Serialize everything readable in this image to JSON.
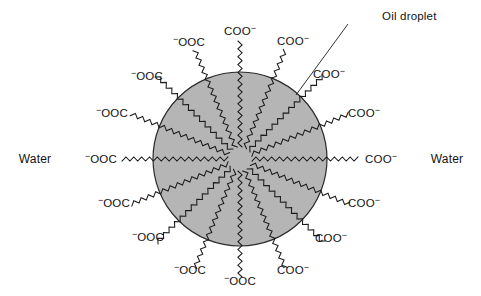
{
  "figure": {
    "type": "emulsion-oil-droplet-surfactant-diagram",
    "width": 481,
    "height": 296,
    "background_color": "#ffffff"
  },
  "droplet": {
    "label": "Oil droplet",
    "center_x": 240,
    "center_y": 159,
    "radius": 87,
    "fill_color": "#b5b5b5",
    "stroke_color": "#2a2a2a"
  },
  "callout": {
    "text": "Oil droplet",
    "text_x": 382,
    "text_y": 17,
    "leader_from_x": 348,
    "leader_from_y": 24,
    "leader_to_x": 296,
    "leader_to_y": 95
  },
  "medium": {
    "left": {
      "text": "Water",
      "x": 35,
      "y": 159
    },
    "right": {
      "text": "Water",
      "x": 447,
      "y": 159
    }
  },
  "head_groups": {
    "left_text": "⁻OOC",
    "right_text": "COO⁻",
    "left_head": "OOC",
    "right_head": "COO",
    "charge": "−"
  },
  "surfactants": [
    {
      "id": 1,
      "angle_deg": -90,
      "side": "right",
      "label": "COO⁻",
      "label_x": 240,
      "label_y": 31,
      "tail_inner_r": 12,
      "tail_outer_r": 118
    },
    {
      "id": 2,
      "angle_deg": -67.5,
      "side": "right",
      "label": "COO⁻",
      "label_x": 293,
      "label_y": 41,
      "tail_inner_r": 12,
      "tail_outer_r": 118
    },
    {
      "id": 3,
      "angle_deg": -45,
      "side": "right",
      "label": "COO⁻",
      "label_x": 329,
      "label_y": 74,
      "tail_inner_r": 12,
      "tail_outer_r": 118
    },
    {
      "id": 4,
      "angle_deg": -22.5,
      "side": "right",
      "label": "COO⁻",
      "label_x": 364,
      "label_y": 113,
      "tail_inner_r": 12,
      "tail_outer_r": 118
    },
    {
      "id": 5,
      "angle_deg": 0,
      "side": "right",
      "label": "COO⁻",
      "label_x": 381,
      "label_y": 159,
      "tail_inner_r": 12,
      "tail_outer_r": 118
    },
    {
      "id": 6,
      "angle_deg": 22.5,
      "side": "right",
      "label": "COO⁻",
      "label_x": 364,
      "label_y": 203,
      "tail_inner_r": 12,
      "tail_outer_r": 118
    },
    {
      "id": 7,
      "angle_deg": 45,
      "side": "right",
      "label": "COO⁻",
      "label_x": 331,
      "label_y": 238,
      "tail_inner_r": 12,
      "tail_outer_r": 118
    },
    {
      "id": 8,
      "angle_deg": 67.5,
      "side": "right",
      "label": "COO⁻",
      "label_x": 293,
      "label_y": 270,
      "tail_inner_r": 12,
      "tail_outer_r": 118
    },
    {
      "id": 9,
      "angle_deg": 90,
      "side": "left",
      "label": "COO⁻",
      "label_x": 240,
      "label_y": 281,
      "tail_inner_r": 12,
      "tail_outer_r": 118
    },
    {
      "id": 10,
      "angle_deg": 112.5,
      "side": "left",
      "label": "⁻OOC",
      "label_x": 190,
      "label_y": 270,
      "tail_inner_r": 12,
      "tail_outer_r": 118
    },
    {
      "id": 11,
      "angle_deg": 135,
      "side": "left",
      "label": "⁻OOC",
      "label_x": 148,
      "label_y": 237,
      "tail_inner_r": 12,
      "tail_outer_r": 118
    },
    {
      "id": 12,
      "angle_deg": 157.5,
      "side": "left",
      "label": "⁻OOC",
      "label_x": 114,
      "label_y": 203,
      "tail_inner_r": 12,
      "tail_outer_r": 118
    },
    {
      "id": 13,
      "angle_deg": 180,
      "side": "left",
      "label": "⁻OOC",
      "label_x": 101,
      "label_y": 159,
      "tail_inner_r": 12,
      "tail_outer_r": 118
    },
    {
      "id": 14,
      "angle_deg": 202.5,
      "side": "left",
      "label": "⁻OOC",
      "label_x": 112,
      "label_y": 113,
      "tail_inner_r": 12,
      "tail_outer_r": 118
    },
    {
      "id": 15,
      "angle_deg": 225,
      "side": "left",
      "label": "⁻OOC",
      "label_x": 147,
      "label_y": 76,
      "tail_inner_r": 12,
      "tail_outer_r": 118
    },
    {
      "id": 16,
      "angle_deg": 247.5,
      "side": "left",
      "label": "⁻OOC",
      "label_x": 189,
      "label_y": 42,
      "tail_inner_r": 12,
      "tail_outer_r": 118
    }
  ]
}
